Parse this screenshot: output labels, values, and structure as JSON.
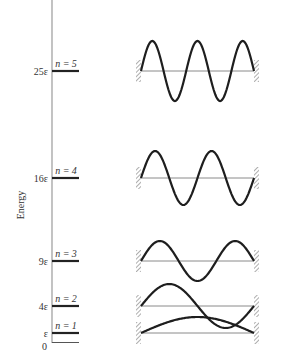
{
  "diagram": {
    "axis_title": "Energy",
    "zero_label": "0",
    "levels": [
      {
        "n": 1,
        "n_label": "n = 1",
        "energy_label": "ε",
        "y": 333,
        "amplitude": 16
      },
      {
        "n": 2,
        "n_label": "n = 2",
        "energy_label": "4ε",
        "y": 306,
        "amplitude": 22
      },
      {
        "n": 3,
        "n_label": "n = 3",
        "energy_label": "9ε",
        "y": 261,
        "amplitude": 20
      },
      {
        "n": 4,
        "n_label": "n = 4",
        "energy_label": "16ε",
        "y": 178,
        "amplitude": 27
      },
      {
        "n": 5,
        "n_label": "n = 5",
        "energy_label": "25ε",
        "y": 71,
        "amplitude": 30
      }
    ],
    "colors": {
      "line": "#1e1e1e",
      "axis": "#9a9a9a",
      "text": "#333333"
    }
  }
}
